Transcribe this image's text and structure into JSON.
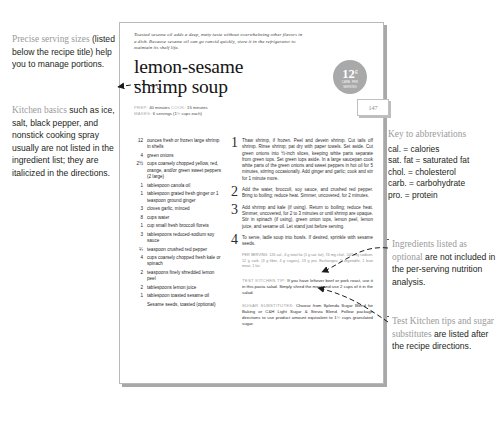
{
  "callouts": {
    "serving": {
      "lead": "Precise serving sizes",
      "rest": " (listed below the recipe title) help you to manage portions."
    },
    "basics": {
      "lead": "Kitchen basics",
      "rest": " such as ice, salt, black pepper, and nonstick cooking spray usually are not listed in the ingredient list; they are italicized in the directions."
    },
    "abbrev": {
      "lead": "Key to abbreviations",
      "lines": [
        "cal. = calories",
        "sat. fat = saturated fat",
        "chol. = cholesterol",
        "carb. = carbohydrate",
        "pro. = protein"
      ]
    },
    "optional": {
      "lead": "Ingredients listed as optional",
      "rest": " are not included in the per-serving nutrition analysis."
    },
    "tips": {
      "lead": "Test Kitchen tips and sugar substitutes",
      "rest": " are listed after the recipe directions."
    }
  },
  "page": {
    "folio": "147",
    "blurb": "Toasted sesame oil adds a deep, nutty taste without overwhelming other flavors in a dish. Because sesame oil can go rancid quickly, store it in the refrigerator to maintain its shelf life.",
    "title_line1": "lemon-sesame",
    "title_line2": "shrimp soup",
    "meta": {
      "prep_key": "PREP:",
      "prep_val": "40 minutes",
      "cook_key": "COOK:",
      "cook_val": "15 minutes",
      "makes_key": "MAKES:",
      "makes_val": "6 servings (1½ cups each)"
    },
    "badge": {
      "number": "12",
      "unit": "g",
      "sub_line1": "CARB. PER",
      "sub_line2": "SERVING"
    },
    "ingredients": [
      {
        "amount": "12",
        "text": "ounces fresh or frozen large shrimp in shells"
      },
      {
        "amount": "4",
        "text": "green onions"
      },
      {
        "amount": "2½",
        "text": "cups coarsely chopped yellow, red, orange, and/or green sweet peppers (2 large)"
      },
      {
        "amount": "1",
        "text": "tablespoon canola oil"
      },
      {
        "amount": "1",
        "text": "tablespoon grated fresh ginger or 1 teaspoon ground ginger"
      },
      {
        "amount": "3",
        "text": "cloves garlic, minced"
      },
      {
        "amount": "8",
        "text": "cups water"
      },
      {
        "amount": "1",
        "text": "cup small fresh broccoli florets"
      },
      {
        "amount": "3",
        "text": "tablespoons reduced-sodium soy sauce"
      },
      {
        "amount": "¼",
        "text": "teaspoon crushed red pepper"
      },
      {
        "amount": "4",
        "text": "cups coarsely chopped fresh kale or spinach"
      },
      {
        "amount": "2",
        "text": "teaspoons finely shredded lemon peel"
      },
      {
        "amount": "2",
        "text": "tablespoons lemon juice"
      },
      {
        "amount": "1",
        "text": "tablespoon toasted sesame oil"
      },
      {
        "amount": "",
        "text": "Sesame seeds, toasted (optional)"
      }
    ],
    "directions": [
      {
        "n": "1",
        "text": "Thaw shrimp, if frozen. Peel and devein shrimp. Cut tails off shrimp. Rinse shrimp; pat dry with paper towels. Set aside. Cut green onions into ½-inch slices, keeping white parts separate from green tops. Set green tops aside. In a large saucepan cook white parts of the green onions and sweet peppers in hot oil for 5 minutes, stirring occasionally. Add ginger and garlic; cook and stir for 1 minute more."
      },
      {
        "n": "2",
        "text": "Add the water, broccoli, soy sauce, and crushed red pepper. Bring to boiling; reduce heat. Simmer, uncovered, for 2 minutes."
      },
      {
        "n": "3",
        "text": "Add shrimp and kale (if using). Return to boiling; reduce heat. Simmer, uncovered, for 2 to 3 minutes or until shrimp are opaque. Stir in spinach (if using), green onion tops, lemon peel, lemon juice, and sesame oil. Let stand just before serving."
      },
      {
        "n": "4",
        "text": "To serve, ladle soup into bowls. If desired, sprinkle with sesame seeds."
      }
    ],
    "nutrition": "PER SERVING: 126 cal., 4 g total fat (1 g sat. fat), 74 mg chol., 547 mg sodium, 12 g carb. (3 g fiber, 4 g sugars), 13 g pro. Exchanges: 2 vegetable, 1 lean meat, 1 fat.",
    "tips": [
      {
        "head": "TEST KITCHEN TIP:",
        "text": " If you have leftover beef or pork roast, use it in this pasta salad. Simply shred the meat and use 2 cups of it in the salad."
      },
      {
        "head": "SUGAR SUBSTITUTES:",
        "text": " Choose from Splenda Sugar Blend for Baking or C&H Light Sugar & Stevia Blend. Follow package directions to use product amount equivalent to 1½ cups granulated sugar."
      }
    ]
  }
}
